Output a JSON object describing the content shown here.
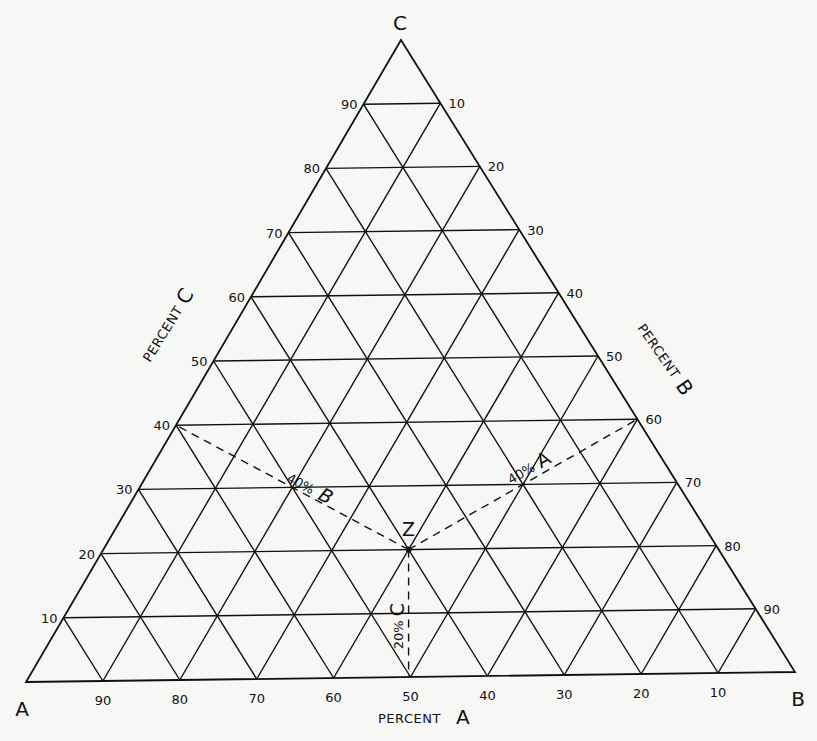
{
  "figure": {
    "type": "ternary-diagram",
    "vertices": {
      "A": {
        "label": "A",
        "x": 26,
        "y": 682
      },
      "B": {
        "label": "B",
        "x": 795,
        "y": 672
      },
      "C": {
        "label": "C",
        "x": 401,
        "y": 40
      }
    },
    "grid_step_percent": 10,
    "axes": {
      "left": {
        "word": "PERCENT",
        "letter": "C",
        "ticks": [
          "10",
          "20",
          "30",
          "40",
          "50",
          "60",
          "70",
          "80",
          "90"
        ]
      },
      "right": {
        "word": "PERCENT",
        "letter": "B",
        "ticks": [
          "10",
          "20",
          "30",
          "40",
          "50",
          "60",
          "70",
          "80",
          "90"
        ]
      },
      "bottom": {
        "word": "PERCENT",
        "letter": "A",
        "ticks": [
          "90",
          "80",
          "70",
          "60",
          "50",
          "40",
          "30",
          "20",
          "10"
        ]
      }
    },
    "point": {
      "label": "Z",
      "composition": {
        "A": 40,
        "B": 40,
        "C": 20
      }
    },
    "annotations": {
      "to_A": {
        "percent": "40%",
        "letter": "A"
      },
      "to_B": {
        "percent": "40%",
        "letter": "B"
      },
      "to_C": {
        "percent": "20%",
        "letter": "C"
      }
    },
    "colors": {
      "ink": "#111111",
      "paper": "#f7f7f5"
    }
  },
  "chart_data": {
    "type": "scatter",
    "title": "",
    "subtype": "ternary",
    "axes": [
      "Percent A",
      "Percent B",
      "Percent C"
    ],
    "tick_labels": [
      10,
      20,
      30,
      40,
      50,
      60,
      70,
      80,
      90
    ],
    "grid": true,
    "points": [
      {
        "label": "Z",
        "A": 40,
        "B": 40,
        "C": 20
      }
    ]
  }
}
